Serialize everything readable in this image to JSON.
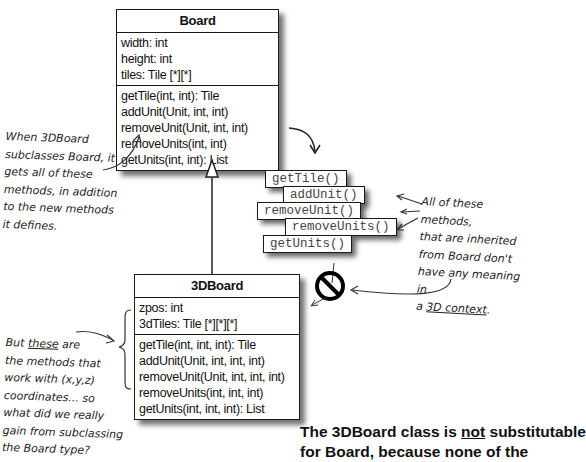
{
  "board": {
    "name": "Board",
    "attributes": [
      "width: int",
      "height: int",
      "tiles: Tile [*][*]"
    ],
    "methods": [
      "getTile(int, int): Tile",
      "addUnit(Unit, int, int)",
      "removeUnit(Unit, int, int)",
      "removeUnits(int, int)",
      "getUnits(int, int): List"
    ]
  },
  "board3d": {
    "name": "3DBoard",
    "attributes": [
      "zpos: int",
      "3dTiles: Tile [*][*][*]"
    ],
    "methods": [
      "getTile(int, int, int): Tile",
      "addUnit(Unit, int, int, int)",
      "removeUnit(Unit, int, int, int)",
      "removeUnits(int, int, int)",
      "getUnits(int, int, int): List"
    ]
  },
  "inherited_tags": [
    "getTile()",
    "addUnit()",
    "removeUnit()",
    "removeUnits()",
    "getUnits()"
  ],
  "notes": {
    "left_top": [
      "When 3DBoard",
      "subclasses Board, it",
      "gets all of these",
      "methods, in addition",
      "to the new methods",
      "it defines."
    ],
    "right": [
      "All of these methods,",
      "that are inherited",
      "from Board don't",
      "have any meaning in"
    ],
    "right_last_prefix": "a ",
    "right_last_underlined": "3D context",
    "right_last_suffix": ".",
    "left_bottom_first_prefix": "But ",
    "left_bottom_first_underlined": "these",
    "left_bottom_first_suffix": " are",
    "left_bottom": [
      "the methods that",
      "work with (x,y,z)",
      "coordinates... so",
      "what did we really",
      "gain from subclassing",
      "the Board type?"
    ]
  },
  "caption": {
    "prefix": "The 3DBoard class is ",
    "underlined": "not",
    "suffix": " substitutable",
    "line2": "for Board, because none of the"
  }
}
